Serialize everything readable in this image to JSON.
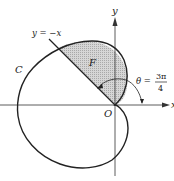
{
  "diagram": {
    "type": "polar-curve-region",
    "axes": {
      "x_label": "x",
      "y_label": "y",
      "origin_label": "O"
    },
    "curve": {
      "label": "C",
      "stroke_color": "#222222"
    },
    "line": {
      "label": "y = −x"
    },
    "region": {
      "label": "F",
      "fill_color": "#c8c8c8"
    },
    "angle": {
      "symbol": "θ =",
      "numerator": "3π",
      "denominator": "4"
    }
  }
}
